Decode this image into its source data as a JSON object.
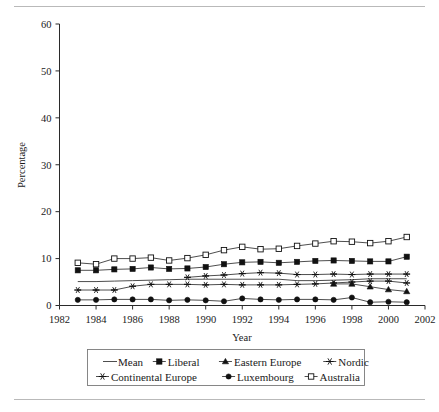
{
  "chart_data": {
    "type": "line",
    "title": "",
    "xlabel": "Year",
    "ylabel": "Percentage",
    "xlim": [
      1982,
      2002
    ],
    "ylim": [
      0,
      60
    ],
    "xticks": [
      "1982",
      "1984",
      "1986",
      "1988",
      "1990",
      "1992",
      "1994",
      "1996",
      "1998",
      "2000",
      "2002"
    ],
    "yticks": [
      "0",
      "10",
      "20",
      "30",
      "40",
      "50",
      "60"
    ],
    "grid": false,
    "legend_position": "below-axes",
    "x": [
      1983,
      1984,
      1985,
      1986,
      1987,
      1988,
      1989,
      1990,
      1991,
      1992,
      1993,
      1994,
      1995,
      1996,
      1997,
      1998,
      1999,
      2000,
      2001
    ],
    "series": [
      {
        "name": "Mean",
        "marker": "none",
        "values": [
          5.1,
          5.1,
          5.2,
          5.3,
          5.4,
          5.5,
          5.6,
          5.6,
          5.6,
          5.6,
          5.6,
          5.6,
          5.3,
          5.3,
          5.4,
          5.5,
          5.7,
          5.7,
          5.7
        ]
      },
      {
        "name": "Liberal",
        "marker": "filled-square",
        "values": [
          7.5,
          7.5,
          7.7,
          7.8,
          8.1,
          7.8,
          7.9,
          8.2,
          8.8,
          9.2,
          9.3,
          9.1,
          9.3,
          9.5,
          9.6,
          9.5,
          9.4,
          9.4,
          10.4
        ]
      },
      {
        "name": "Eastern Europe",
        "marker": "filled-triangle",
        "values": [
          null,
          null,
          null,
          null,
          null,
          null,
          null,
          null,
          null,
          null,
          null,
          null,
          null,
          null,
          4.6,
          4.6,
          4.0,
          3.4,
          3.0
        ]
      },
      {
        "name": "Nordic",
        "marker": "star",
        "values": [
          null,
          null,
          null,
          null,
          null,
          null,
          6.0,
          6.3,
          6.5,
          6.8,
          7.0,
          6.9,
          6.6,
          6.6,
          6.7,
          6.6,
          6.7,
          6.7,
          6.7
        ]
      },
      {
        "name": "Continental Europe",
        "marker": "star-thin",
        "values": [
          3.3,
          3.3,
          3.3,
          4.1,
          4.5,
          4.5,
          4.5,
          4.4,
          4.5,
          4.4,
          4.4,
          4.4,
          4.5,
          4.6,
          4.8,
          5.0,
          5.2,
          5.2,
          4.8
        ]
      },
      {
        "name": "Luxembourg",
        "marker": "filled-circle",
        "values": [
          1.2,
          1.2,
          1.3,
          1.3,
          1.3,
          1.1,
          1.2,
          1.1,
          0.9,
          1.5,
          1.3,
          1.2,
          1.3,
          1.3,
          1.2,
          1.7,
          0.7,
          0.8,
          0.7
        ]
      },
      {
        "name": "Australia",
        "marker": "open-square",
        "values": [
          9.1,
          8.8,
          10.0,
          10.0,
          10.2,
          9.6,
          10.1,
          10.8,
          11.8,
          12.5,
          12.0,
          12.1,
          12.7,
          13.2,
          13.7,
          13.6,
          13.3,
          13.7,
          14.6
        ]
      }
    ]
  },
  "legend": {
    "row1": [
      "Mean",
      "Liberal",
      "Eastern Europe",
      "Nordic"
    ],
    "row2": [
      "Continental Europe",
      "Luxembourg",
      "Australia"
    ]
  },
  "axes": {
    "ylabel": "Percentage",
    "xlabel": "Year"
  }
}
